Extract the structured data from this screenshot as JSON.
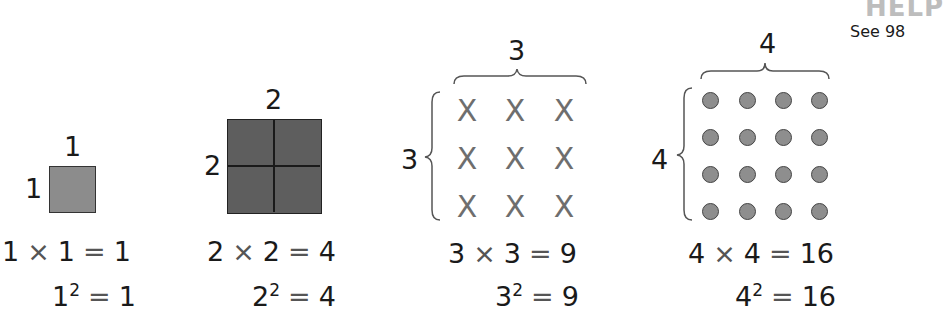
{
  "header": {
    "help_label": "HELP",
    "see_text": "See 98"
  },
  "figures": [
    {
      "top_label": "1",
      "side_label": "1",
      "representation": "shaded-square",
      "product_eq": {
        "a": "1",
        "op": "×",
        "b": "1",
        "eq": "=",
        "result": "1"
      },
      "square_eq": {
        "base": "1",
        "exp": "2",
        "eq": "=",
        "result": "1"
      }
    },
    {
      "top_label": "2",
      "side_label": "2",
      "representation": "2x2-grid-square",
      "product_eq": {
        "a": "2",
        "op": "×",
        "b": "2",
        "eq": "=",
        "result": "4"
      },
      "square_eq": {
        "base": "2",
        "exp": "2",
        "eq": "=",
        "result": "4"
      }
    },
    {
      "top_label": "3",
      "side_label": "3",
      "representation": "3x3-array-of-x",
      "mark": "X",
      "product_eq": {
        "a": "3",
        "op": "×",
        "b": "3",
        "eq": "=",
        "result": "9"
      },
      "square_eq": {
        "base": "3",
        "exp": "2",
        "eq": "=",
        "result": "9"
      }
    },
    {
      "top_label": "4",
      "side_label": "4",
      "representation": "4x4-array-of-dots",
      "product_eq": {
        "a": "4",
        "op": "×",
        "b": "4",
        "eq": "=",
        "result": "16"
      },
      "square_eq": {
        "base": "4",
        "exp": "2",
        "eq": "=",
        "result": "16"
      }
    }
  ],
  "colors": {
    "small_square": "#8c8c8c",
    "large_square": "#5e5e5e",
    "x_mark": "#6e6e6e",
    "dot": "#8e8e8e",
    "help": "#bdbdbd"
  }
}
